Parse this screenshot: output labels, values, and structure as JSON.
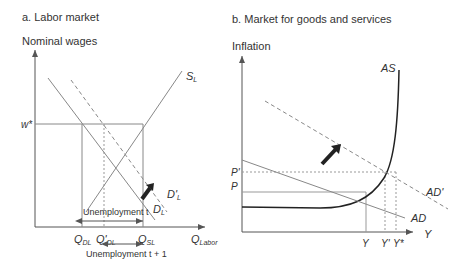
{
  "panel_a": {
    "title": "a. Labor market",
    "y_axis_label": "Nominal wages",
    "x_axis_label_main": "Q",
    "x_axis_label_sub": "Labor",
    "wage_label": "w*",
    "supply_label_main": "S",
    "supply_label_sub": "L",
    "demand_label_main": "D",
    "demand_label_sub": "L",
    "demand_shift_label_main": "D'",
    "demand_shift_label_sub": "L",
    "tick_qdl_main": "Q",
    "tick_qdl_sub": "DL",
    "tick_qdl_prime_main": "Q'",
    "tick_qdl_prime_sub": "DL",
    "tick_qsl_main": "Q",
    "tick_qsl_sub": "SL",
    "unemployment_t": "Unemployment t",
    "unemployment_t1": "Unemployment t + 1"
  },
  "panel_b": {
    "title": "b. Market for goods and services",
    "y_axis_label": "Inflation",
    "x_axis_label": "Y",
    "as_label": "AS",
    "ad_label": "AD",
    "ad_shift_label": "AD'",
    "p_label": "P",
    "p_prime_label": "P'",
    "tick_y": "Y",
    "tick_y_prime": "Y'",
    "tick_y_star": "Y*"
  },
  "colors": {
    "line": "#6f6f6f",
    "dark": "#222222",
    "text": "#333333"
  }
}
